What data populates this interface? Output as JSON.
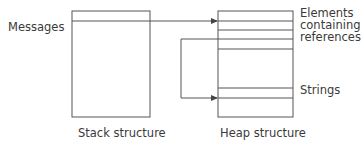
{
  "diagram": {
    "stack": {
      "caption": "Stack structure",
      "entry_label": "Messages"
    },
    "heap": {
      "caption": "Heap structure",
      "labels": {
        "elements_line1": "Elements",
        "elements_line2": "containing",
        "elements_line3": "references",
        "strings": "Strings"
      }
    },
    "colors": {
      "stroke": "#555555",
      "text": "#3a3a3a",
      "background": "#ffffff"
    }
  }
}
